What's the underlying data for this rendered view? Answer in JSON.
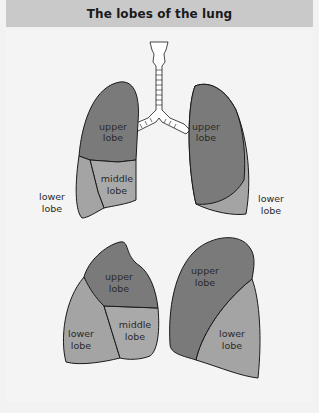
{
  "title": "The lobes of the lung",
  "colors": {
    "header_bg": "#c9c9c9",
    "upper_lobe": "#7a7a7a",
    "middle_lobe": "#a9a9a9",
    "lower_lobe": "#a4a4a4",
    "outline": "#1a1a1a",
    "background": "#f4f4f4"
  },
  "front_view": {
    "right_lung": {
      "upper": [
        "upper",
        "lobe"
      ],
      "middle": [
        "middle",
        "lobe"
      ],
      "lower": [
        "lower",
        "lobe"
      ]
    },
    "left_lung": {
      "upper": [
        "upper",
        "lobe"
      ],
      "lower": [
        "lower",
        "lobe"
      ]
    }
  },
  "side_view": {
    "right_lung": {
      "upper": [
        "upper",
        "lobe"
      ],
      "middle": [
        "middle",
        "lobe"
      ],
      "lower": [
        "lower",
        "lobe"
      ]
    },
    "left_lung": {
      "upper": [
        "upper",
        "lobe"
      ],
      "lower": [
        "lower",
        "lobe"
      ]
    }
  }
}
